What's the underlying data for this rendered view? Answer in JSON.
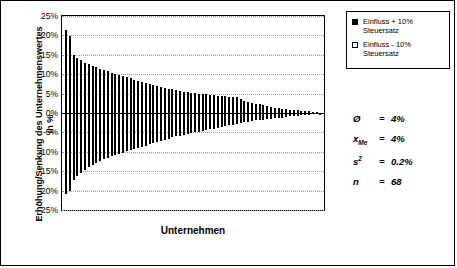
{
  "chart_data": {
    "type": "bar",
    "title": "",
    "xlabel": "Unternehmen",
    "ylabel": "Erhöhung/Senkung des Unternehmenswertes in %",
    "ylim": [
      -25,
      25
    ],
    "ytick_labels": [
      "25%",
      "20%",
      "15%",
      "10%",
      "5%",
      "0%",
      "-5%",
      "-10%",
      "-15%",
      "-20%",
      "-25%"
    ],
    "ytick_values": [
      25,
      20,
      15,
      10,
      5,
      0,
      -5,
      -10,
      -15,
      -20,
      -25
    ],
    "grid": true,
    "legend_position": "right-top",
    "series": [
      {
        "name": "Einfluss + 10% Steuersatz",
        "style": "filled-black",
        "values": [
          -21.0,
          -20.2,
          -17.2,
          -16.3,
          -15.4,
          -14.6,
          -13.9,
          -13.3,
          -12.8,
          -12.3,
          -11.9,
          -11.5,
          -11.1,
          -10.8,
          -10.5,
          -10.2,
          -9.9,
          -9.6,
          -9.3,
          -9.0,
          -8.7,
          -8.4,
          -8.1,
          -7.8,
          -7.5,
          -7.2,
          -6.9,
          -6.6,
          -6.3,
          -6.0,
          -5.8,
          -5.6,
          -5.4,
          -5.2,
          -5.0,
          -4.8,
          -4.6,
          -4.4,
          -4.2,
          -4.0,
          -3.8,
          -3.6,
          -3.4,
          -3.2,
          -3.0,
          -2.8,
          -2.6,
          -2.4,
          -2.2,
          -2.0,
          -1.9,
          -1.8,
          -1.7,
          -1.6,
          -1.5,
          -1.4,
          -1.3,
          -1.2,
          -1.0,
          -0.9,
          -0.8,
          -0.7,
          -0.6,
          -0.5,
          -0.4,
          -0.3,
          -0.2,
          -0.1
        ]
      },
      {
        "name": "Einfluss - 10% Steuersatz",
        "style": "open-white",
        "values": [
          21.4,
          19.8,
          15.0,
          14.2,
          13.6,
          13.0,
          12.6,
          12.2,
          11.8,
          11.4,
          11.0,
          10.7,
          10.4,
          10.1,
          9.8,
          9.5,
          9.2,
          8.9,
          8.6,
          8.3,
          8.0,
          7.7,
          7.4,
          7.1,
          6.9,
          6.7,
          6.5,
          6.3,
          6.1,
          5.9,
          5.7,
          5.5,
          5.3,
          5.2,
          5.1,
          5.0,
          4.9,
          4.8,
          4.7,
          4.6,
          4.5,
          4.4,
          4.3,
          4.2,
          4.1,
          4.0,
          3.6,
          3.2,
          2.9,
          2.6,
          2.4,
          2.2,
          2.0,
          1.8,
          1.6,
          1.4,
          1.2,
          1.1,
          1.0,
          0.9,
          0.8,
          0.7,
          0.6,
          0.5,
          0.4,
          0.3,
          0.2,
          0.1
        ]
      }
    ]
  },
  "legend": {
    "items": [
      {
        "label_line1": "Einfluss + 10%",
        "label_line2": "Steuersatz",
        "swatch": "filled"
      },
      {
        "label_line1": "Einfluss - 10%",
        "label_line2": "Steuersatz",
        "swatch": "open"
      }
    ]
  },
  "stats": [
    {
      "symbol": "Ø",
      "sub": "",
      "sup": "",
      "eq": "=",
      "value": "4%"
    },
    {
      "symbol": "x",
      "sub": "Me",
      "sup": "",
      "eq": "=",
      "value": "4%"
    },
    {
      "symbol": "s",
      "sub": "",
      "sup": "2",
      "eq": "=",
      "value": "0.2%"
    },
    {
      "symbol": "n",
      "sub": "",
      "sup": "",
      "eq": "=",
      "value": "68"
    }
  ]
}
